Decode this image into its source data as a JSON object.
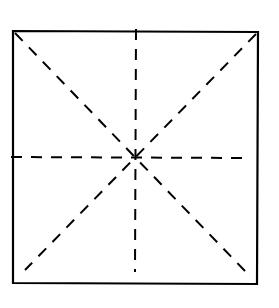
{
  "diagram": {
    "shape": "square",
    "stroke_color": "#000000",
    "background_color": "#ffffff",
    "square": {
      "top_left": [
        13,
        31
      ],
      "top_right": [
        258,
        32
      ],
      "bottom_right": [
        257,
        284
      ],
      "bottom_left": [
        13,
        283
      ]
    },
    "center": [
      136,
      157
    ],
    "dashed_lines": [
      {
        "name": "vertical-axis",
        "from": [
          136,
          29
        ],
        "to": [
          135,
          272
        ]
      },
      {
        "name": "horizontal-axis",
        "from": [
          11,
          157
        ],
        "to": [
          246,
          158
        ]
      },
      {
        "name": "diagonal-top-left-to-bottom-right",
        "from": [
          15,
          33
        ],
        "to": [
          245,
          271
        ]
      },
      {
        "name": "diagonal-top-right-to-bottom-left",
        "from": [
          256,
          34
        ],
        "to": [
          25,
          270
        ]
      }
    ],
    "line_style": "dashed",
    "line_count": 4
  }
}
